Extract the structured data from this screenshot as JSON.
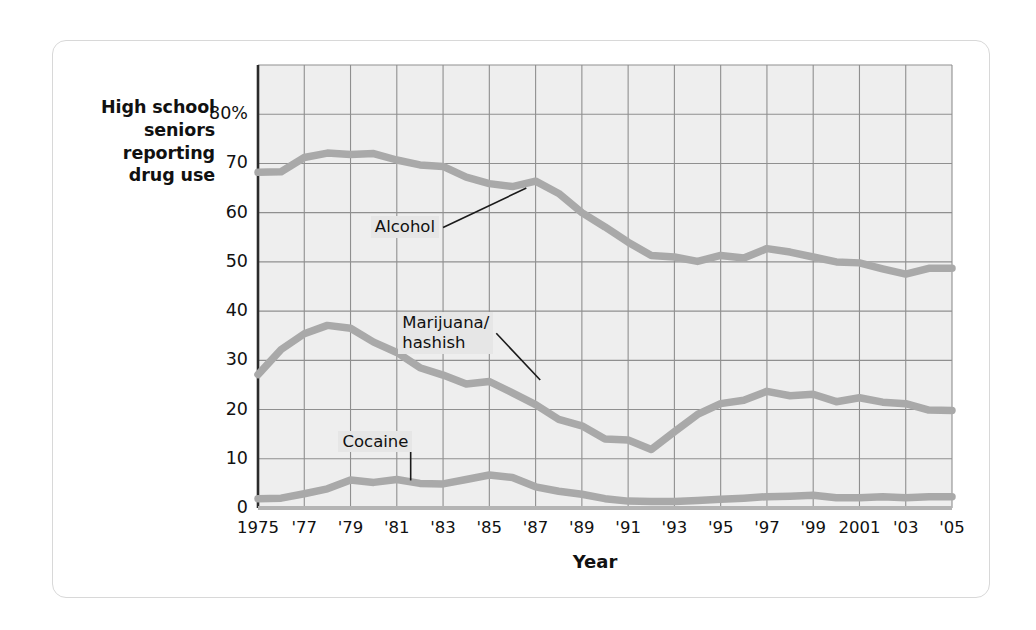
{
  "figure": {
    "y_axis_caption": "High school\nseniors\nreporting\ndrug use",
    "x_axis_title": "Year"
  },
  "chart_data": {
    "type": "line",
    "title": "",
    "subtitle": "",
    "xlabel": "Year",
    "ylabel": "High school seniors reporting drug use",
    "xlim": [
      1975,
      2005
    ],
    "ylim": [
      0,
      90
    ],
    "grid": true,
    "legend_position": "inline-annotations",
    "y_ticks": [
      0,
      10,
      20,
      30,
      40,
      50,
      60,
      70,
      80
    ],
    "y_tick_labels": [
      "0",
      "10",
      "20",
      "30",
      "40",
      "50",
      "60",
      "70",
      "80%"
    ],
    "x_ticks": [
      1975,
      1977,
      1979,
      1981,
      1983,
      1985,
      1987,
      1989,
      1991,
      1993,
      1995,
      1997,
      1999,
      2001,
      2003,
      2005
    ],
    "x_tick_labels": [
      "1975",
      "'77",
      "'79",
      "'81",
      "'83",
      "'85",
      "'87",
      "'89",
      "'91",
      "'93",
      "'95",
      "'97",
      "'99",
      "2001",
      "'03",
      "'05"
    ],
    "x": [
      1975,
      1976,
      1977,
      1978,
      1979,
      1980,
      1981,
      1982,
      1983,
      1984,
      1985,
      1986,
      1987,
      1988,
      1989,
      1990,
      1991,
      1992,
      1993,
      1994,
      1995,
      1996,
      1997,
      1998,
      1999,
      2000,
      2001,
      2002,
      2003,
      2004,
      2005
    ],
    "series": [
      {
        "name": "Alcohol",
        "color": "#a9a9a9",
        "label_x": 1983.0,
        "label_y": 57.0,
        "leader_to_x": 1986.6,
        "leader_to_y": 65.0,
        "values": [
          68.2,
          68.3,
          71.2,
          72.1,
          71.8,
          72.0,
          70.7,
          69.7,
          69.4,
          67.2,
          65.9,
          65.3,
          66.4,
          63.9,
          60.0,
          57.1,
          54.0,
          51.3,
          51.0,
          50.1,
          51.3,
          50.8,
          52.7,
          52.0,
          51.0,
          50.0,
          49.8,
          48.6,
          47.5,
          48.7,
          48.7
        ]
      },
      {
        "name": "Marijuana/\nhashish",
        "color": "#a9a9a9",
        "label_x": 1985.3,
        "label_y": 35.5,
        "leader_to_x": 1987.2,
        "leader_to_y": 26.0,
        "values": [
          27.1,
          32.2,
          35.4,
          37.1,
          36.5,
          33.7,
          31.6,
          28.5,
          27.0,
          25.2,
          25.7,
          23.4,
          21.0,
          18.0,
          16.7,
          14.0,
          13.8,
          11.9,
          15.5,
          19.0,
          21.2,
          21.9,
          23.7,
          22.8,
          23.1,
          21.6,
          22.4,
          21.5,
          21.2,
          19.9,
          19.8
        ]
      },
      {
        "name": "Cocaine",
        "color": "#a9a9a9",
        "label_x": 1981.6,
        "label_y": 13.5,
        "leader_to_x": 1981.6,
        "leader_to_y": 5.6,
        "values": [
          1.9,
          2.0,
          2.9,
          3.9,
          5.7,
          5.2,
          5.8,
          5.0,
          4.9,
          5.8,
          6.7,
          6.2,
          4.3,
          3.4,
          2.8,
          1.9,
          1.4,
          1.3,
          1.3,
          1.5,
          1.8,
          2.0,
          2.3,
          2.4,
          2.6,
          2.1,
          2.1,
          2.3,
          2.1,
          2.3,
          2.3
        ]
      }
    ]
  }
}
